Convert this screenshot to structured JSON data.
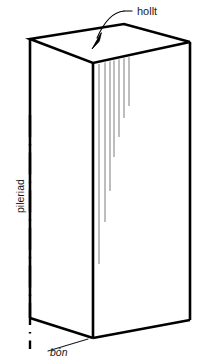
{
  "figure": {
    "background_color": "#ffffff",
    "stroke_color": "#000000",
    "crack_color": "#6d6d6d",
    "labels": {
      "top_callout": "hollt",
      "vertical_axis": "pileriad",
      "bottom": "bón"
    }
  },
  "geometry": {
    "top_face": {
      "left": [
        30,
        39
      ],
      "front": [
        93,
        63
      ],
      "right": [
        190,
        42
      ],
      "back": [
        124,
        24
      ]
    },
    "front_edge_bottom": [
      93,
      338
    ],
    "left_edge_bottom": [
      30,
      318
    ],
    "right_edge_bottom": [
      190,
      320
    ],
    "centerline_x": 30,
    "centerline_top": 118,
    "centerline_bottom": 348
  },
  "hatch_band": {
    "description": "parallel-lines-split-band-on-top-face",
    "line_count": 9
  },
  "cracks": {
    "description": "vertical-hairline-cracks-on-front-face",
    "count": 7,
    "lengths": [
      200,
      160,
      130,
      97,
      78,
      60,
      49
    ]
  },
  "callout": {
    "label": "hollt",
    "arrow_from": [
      140,
      16
    ],
    "arrow_to": [
      95,
      47
    ]
  }
}
